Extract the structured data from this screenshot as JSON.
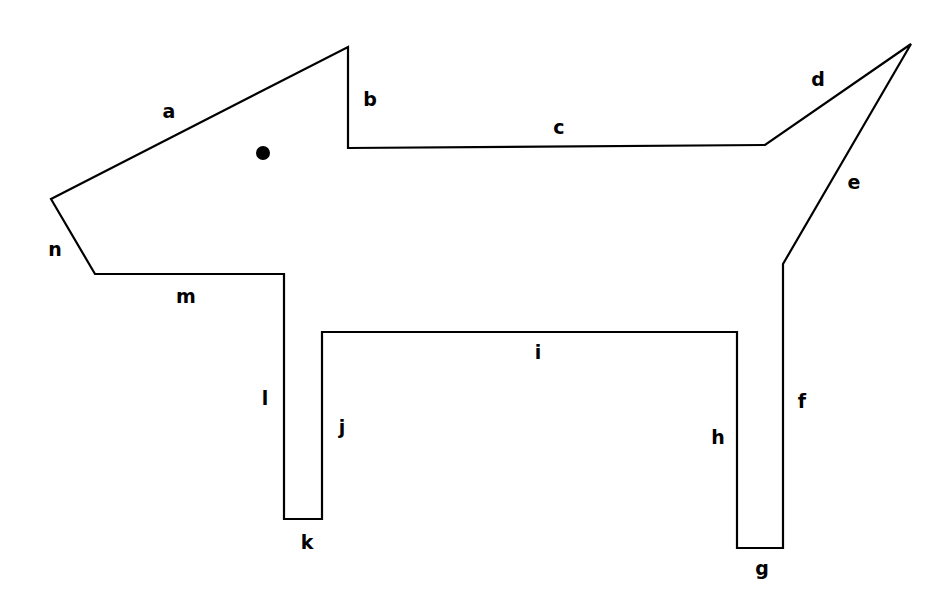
{
  "figure": {
    "name": "labeled-polygon-dog-outline",
    "canvas": {
      "width": 940,
      "height": 611
    },
    "background_color": "#ffffff",
    "stroke_color": "#000000",
    "stroke_width": 2.2,
    "fill": "none",
    "vertices": [
      {
        "id": "v1",
        "x": 51,
        "y": 199
      },
      {
        "id": "v2",
        "x": 348,
        "y": 47
      },
      {
        "id": "v3",
        "x": 348,
        "y": 148
      },
      {
        "id": "v4",
        "x": 765,
        "y": 145
      },
      {
        "id": "v5",
        "x": 911,
        "y": 44
      },
      {
        "id": "v6",
        "x": 783,
        "y": 264
      },
      {
        "id": "v7",
        "x": 783,
        "y": 548
      },
      {
        "id": "v8",
        "x": 737,
        "y": 548
      },
      {
        "id": "v9",
        "x": 737,
        "y": 332
      },
      {
        "id": "v10",
        "x": 322,
        "y": 332
      },
      {
        "id": "v11",
        "x": 322,
        "y": 519
      },
      {
        "id": "v12",
        "x": 284,
        "y": 519
      },
      {
        "id": "v13",
        "x": 284,
        "y": 274
      },
      {
        "id": "v14",
        "x": 95,
        "y": 274
      }
    ],
    "path": "M 51,199 L 348,47 L 348,148 L 765,145 L 911,44 L 783,264 L 783,548 L 737,548 L 737,332 L 322,332 L 322,519 L 284,519 L 284,274 L 95,274 Z",
    "interior_point": {
      "name": "interior-dot",
      "cx": 263,
      "cy": 153,
      "r": 7,
      "color": "#000000"
    },
    "edge_labels": [
      {
        "text": "a",
        "x": 169,
        "y": 111
      },
      {
        "text": "b",
        "x": 370,
        "y": 99
      },
      {
        "text": "c",
        "x": 559,
        "y": 127
      },
      {
        "text": "d",
        "x": 818,
        "y": 79
      },
      {
        "text": "e",
        "x": 854,
        "y": 182
      },
      {
        "text": "f",
        "x": 802,
        "y": 401
      },
      {
        "text": "g",
        "x": 762,
        "y": 568
      },
      {
        "text": "h",
        "x": 718,
        "y": 437
      },
      {
        "text": "i",
        "x": 538,
        "y": 352
      },
      {
        "text": "j",
        "x": 342,
        "y": 427
      },
      {
        "text": "k",
        "x": 307,
        "y": 542
      },
      {
        "text": "l",
        "x": 265,
        "y": 398
      },
      {
        "text": "m",
        "x": 186,
        "y": 296
      },
      {
        "text": "n",
        "x": 55,
        "y": 249
      }
    ]
  }
}
